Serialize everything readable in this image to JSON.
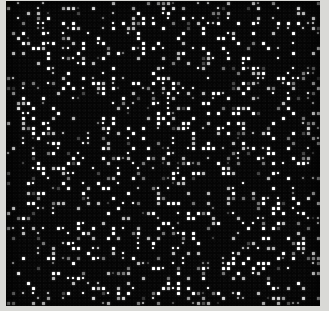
{
  "image": {
    "kind": "dot-lattice-noise-field",
    "caption": "",
    "width_px": 329,
    "height_px": 311,
    "background_color": "#d9d9d6",
    "field": {
      "color": "#050505",
      "left_px": 6,
      "top_px": 1,
      "width_px": 314,
      "height_px": 305
    },
    "lattice": {
      "pitch_px": 5,
      "dot_size_px": 3,
      "dot_color": "#ffffff",
      "fill_fraction": 0.27,
      "columns": 63,
      "rows": 61
    },
    "brightness_levels": [
      1.0,
      0.72,
      0.45,
      0.25
    ]
  }
}
